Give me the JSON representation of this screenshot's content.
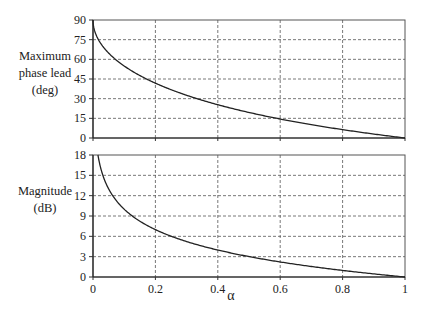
{
  "chart_data": [
    {
      "type": "line",
      "title": "",
      "xlabel": "α",
      "ylabel": "Maximum phase lead (deg)",
      "ylabel_lines": [
        "Maximum",
        "phase lead",
        "(deg)"
      ],
      "xlim": [
        0,
        1
      ],
      "ylim": [
        0,
        90
      ],
      "x_ticks": [
        "0",
        "0.2",
        "0.4",
        "0.6",
        "0.8",
        "1"
      ],
      "y_ticks": [
        "0",
        "15",
        "30",
        "45",
        "60",
        "75",
        "90"
      ],
      "grid": true,
      "grid_style": "dashed",
      "legend": null,
      "series": [
        {
          "name": "Maximum phase lead",
          "formula": "asin((1-α)/(1+α))",
          "x": [
            0.0,
            0.005,
            0.02,
            0.05,
            0.1,
            0.15,
            0.2,
            0.3,
            0.4,
            0.5,
            0.6,
            0.7,
            0.8,
            0.9,
            1.0
          ],
          "y": [
            90.0,
            81.9,
            74.0,
            64.8,
            54.9,
            47.6,
            41.8,
            32.6,
            25.4,
            19.5,
            14.5,
            10.2,
            6.4,
            3.0,
            0.0
          ]
        }
      ]
    },
    {
      "type": "line",
      "title": "",
      "xlabel": "α",
      "ylabel": "Magnitude (dB)",
      "ylabel_lines": [
        "Magnitude",
        "(dB)"
      ],
      "xlim": [
        0,
        1
      ],
      "ylim": [
        0,
        18
      ],
      "x_ticks": [
        "0",
        "0.2",
        "0.4",
        "0.6",
        "0.8",
        "1"
      ],
      "y_ticks": [
        "0",
        "3",
        "6",
        "9",
        "12",
        "15",
        "18"
      ],
      "grid": true,
      "grid_style": "dashed",
      "legend": null,
      "series": [
        {
          "name": "Magnitude",
          "formula": "10*log10(1/α)",
          "x": [
            0.0158,
            0.02,
            0.03,
            0.05,
            0.1,
            0.15,
            0.2,
            0.3,
            0.4,
            0.5,
            0.6,
            0.7,
            0.8,
            0.9,
            1.0
          ],
          "y": [
            18.0,
            17.0,
            15.2,
            13.0,
            10.0,
            8.2,
            7.0,
            5.2,
            4.0,
            3.0,
            2.2,
            1.5,
            1.0,
            0.5,
            0.0
          ]
        }
      ]
    }
  ],
  "labels": {
    "top_ylabel": [
      "Maximum",
      "phase lead",
      "(deg)"
    ],
    "bottom_ylabel": [
      "Magnitude",
      "(dB)"
    ],
    "xlabel": "α"
  }
}
